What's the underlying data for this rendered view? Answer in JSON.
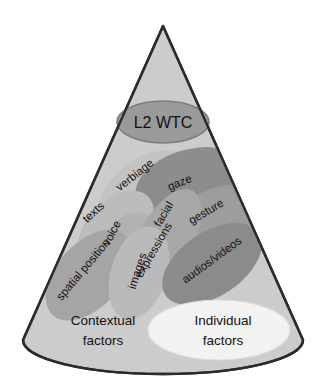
{
  "figure": {
    "name": "L2 WTC cone diagram",
    "shape": "cone",
    "background_color": "#ffffff",
    "cone_fill": "#cccccc",
    "cone_outline": "#2b2b2b"
  },
  "apex_node": {
    "label": "L2 WTC",
    "fill": "#9a9a9a",
    "stroke": "#7d7d7d"
  },
  "base_regions": [
    {
      "label_line1": "Contextual",
      "label_line2": "factors",
      "fill": "none"
    },
    {
      "label_line1": "Individual",
      "label_line2": "factors",
      "fill": "#f2f2f0",
      "stroke": "#d8d8d4"
    }
  ],
  "bubbles": [
    {
      "label": "verbiage",
      "fill": "#c0c0c0",
      "rotation": -38
    },
    {
      "label": "gaze",
      "fill": "#8d8d8d",
      "rotation": -22
    },
    {
      "label": "gesture",
      "fill": "#9b9b9b",
      "rotation": -30
    },
    {
      "label": "texts",
      "fill": "#bdbdbd",
      "rotation": -42
    },
    {
      "label": "voice",
      "fill": "#b4b4b4",
      "rotation": -62
    },
    {
      "label": "facial",
      "fill": "#a6a6a6",
      "rotation": -60
    },
    {
      "label": "expressions",
      "fill": "#a6a6a6",
      "rotation": -60
    },
    {
      "label": "spatial position",
      "fill": "#a5a5a5",
      "rotation": -50
    },
    {
      "label": "images",
      "fill": "#b9b9b9",
      "rotation": -72
    },
    {
      "label": "audios/videos",
      "fill": "#8b8b8b",
      "rotation": -36
    }
  ],
  "colors": {
    "text": "#111111",
    "cone_body": "#cccccc",
    "outline": "#2b2b2b",
    "light_ellipse": "#f2f2f0"
  }
}
